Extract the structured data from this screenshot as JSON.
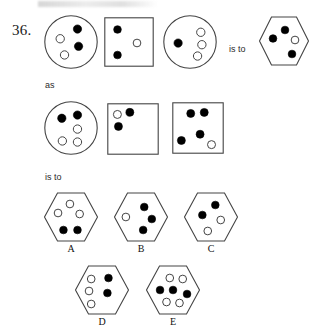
{
  "question": {
    "number": "36.",
    "connector_top": "is to",
    "connector_as": "as",
    "connector_bottom": "is to"
  },
  "puzzle": {
    "type": "visual-analogy",
    "top_row": [
      {
        "name": "circle-1",
        "shape": "circle",
        "dots": [
          {
            "fill": "black",
            "cx": 0.62,
            "cy": 0.26
          },
          {
            "fill": "white",
            "cx": 0.3,
            "cy": 0.44
          },
          {
            "fill": "black",
            "cx": 0.64,
            "cy": 0.58
          },
          {
            "fill": "white",
            "cx": 0.38,
            "cy": 0.74
          }
        ]
      },
      {
        "name": "square-1",
        "shape": "square",
        "dots": [
          {
            "fill": "black",
            "cx": 0.27,
            "cy": 0.25
          },
          {
            "fill": "white",
            "cx": 0.66,
            "cy": 0.52
          },
          {
            "fill": "black",
            "cx": 0.27,
            "cy": 0.76
          }
        ]
      },
      {
        "name": "circle-2",
        "shape": "circle",
        "dots": [
          {
            "fill": "black",
            "cx": 0.28,
            "cy": 0.52
          },
          {
            "fill": "white",
            "cx": 0.7,
            "cy": 0.32
          },
          {
            "fill": "white",
            "cx": 0.72,
            "cy": 0.55
          },
          {
            "fill": "white",
            "cx": 0.64,
            "cy": 0.76
          }
        ]
      },
      {
        "name": "hexagon-1",
        "shape": "hexagon",
        "dots": [
          {
            "fill": "black",
            "cx": 0.52,
            "cy": 0.28
          },
          {
            "fill": "black",
            "cx": 0.28,
            "cy": 0.45
          },
          {
            "fill": "white",
            "cx": 0.72,
            "cy": 0.48
          },
          {
            "fill": "black",
            "cx": 0.66,
            "cy": 0.76
          }
        ]
      }
    ],
    "second_row": [
      {
        "name": "circle-3",
        "shape": "circle",
        "dots": [
          {
            "fill": "black",
            "cx": 0.33,
            "cy": 0.32
          },
          {
            "fill": "black",
            "cx": 0.62,
            "cy": 0.26
          },
          {
            "fill": "white",
            "cx": 0.62,
            "cy": 0.52
          },
          {
            "fill": "white",
            "cx": 0.34,
            "cy": 0.74
          },
          {
            "fill": "white",
            "cx": 0.62,
            "cy": 0.76
          }
        ]
      },
      {
        "name": "square-2",
        "shape": "square",
        "dots": [
          {
            "fill": "white",
            "cx": 0.2,
            "cy": 0.22
          },
          {
            "fill": "black",
            "cx": 0.44,
            "cy": 0.18
          },
          {
            "fill": "black",
            "cx": 0.22,
            "cy": 0.45
          }
        ]
      },
      {
        "name": "square-3",
        "shape": "square",
        "dots": [
          {
            "fill": "black",
            "cx": 0.36,
            "cy": 0.22
          },
          {
            "fill": "black",
            "cx": 0.62,
            "cy": 0.2
          },
          {
            "fill": "black",
            "cx": 0.54,
            "cy": 0.62
          },
          {
            "fill": "black",
            "cx": 0.18,
            "cy": 0.74
          },
          {
            "fill": "white",
            "cx": 0.76,
            "cy": 0.82
          }
        ]
      }
    ],
    "options": [
      {
        "label": "A",
        "name": "option-a",
        "shape": "hexagon",
        "dots": [
          {
            "fill": "white",
            "cx": 0.48,
            "cy": 0.24
          },
          {
            "fill": "white",
            "cx": 0.26,
            "cy": 0.42
          },
          {
            "fill": "white",
            "cx": 0.66,
            "cy": 0.44
          },
          {
            "fill": "black",
            "cx": 0.36,
            "cy": 0.76
          },
          {
            "fill": "black",
            "cx": 0.62,
            "cy": 0.76
          }
        ]
      },
      {
        "label": "B",
        "name": "option-b",
        "shape": "hexagon",
        "dots": [
          {
            "fill": "white",
            "cx": 0.22,
            "cy": 0.5
          },
          {
            "fill": "black",
            "cx": 0.56,
            "cy": 0.3
          },
          {
            "fill": "black",
            "cx": 0.7,
            "cy": 0.54
          },
          {
            "fill": "black",
            "cx": 0.54,
            "cy": 0.76
          }
        ]
      },
      {
        "label": "C",
        "name": "option-c",
        "shape": "hexagon",
        "dots": [
          {
            "fill": "black",
            "cx": 0.58,
            "cy": 0.26
          },
          {
            "fill": "black",
            "cx": 0.34,
            "cy": 0.46
          },
          {
            "fill": "white",
            "cx": 0.68,
            "cy": 0.56
          },
          {
            "fill": "white",
            "cx": 0.44,
            "cy": 0.78
          }
        ]
      },
      {
        "label": "D",
        "name": "option-d",
        "shape": "hexagon",
        "dots": [
          {
            "fill": "white",
            "cx": 0.3,
            "cy": 0.28
          },
          {
            "fill": "black",
            "cx": 0.62,
            "cy": 0.26
          },
          {
            "fill": "white",
            "cx": 0.26,
            "cy": 0.52
          },
          {
            "fill": "black",
            "cx": 0.6,
            "cy": 0.56
          },
          {
            "fill": "white",
            "cx": 0.3,
            "cy": 0.78
          }
        ]
      },
      {
        "label": "E",
        "name": "option-e",
        "shape": "hexagon",
        "dots": [
          {
            "fill": "white",
            "cx": 0.44,
            "cy": 0.26
          },
          {
            "fill": "white",
            "cx": 0.68,
            "cy": 0.28
          },
          {
            "fill": "black",
            "cx": 0.26,
            "cy": 0.5
          },
          {
            "fill": "black",
            "cx": 0.5,
            "cy": 0.5
          },
          {
            "fill": "black",
            "cx": 0.76,
            "cy": 0.58
          },
          {
            "fill": "white",
            "cx": 0.38,
            "cy": 0.74
          },
          {
            "fill": "white",
            "cx": 0.62,
            "cy": 0.76
          }
        ]
      }
    ]
  },
  "colors": {
    "stroke": "#444444",
    "dot_fill": "#000000",
    "dot_empty": "#ffffff",
    "paper": "#ffffff"
  }
}
